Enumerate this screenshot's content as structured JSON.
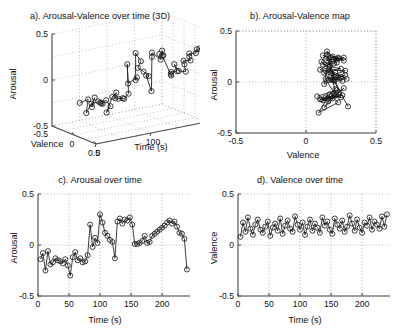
{
  "figure": {
    "background": "#ffffff",
    "line_color": "#1a1a1a",
    "grid_color": "#9a9a9a",
    "axis_color": "#4a4a4a",
    "marker": "circle-open"
  },
  "chart_data": [
    {
      "id": "a",
      "type": "scatter",
      "title": "a). Arousal-Valence over time (3D)",
      "projection": "3d",
      "xlabel": "Valence",
      "ylabel": "Time (s)",
      "zlabel": "Arousal",
      "xlim": [
        -0.5,
        0.5
      ],
      "ylim": [
        0,
        200
      ],
      "zlim": [
        -0.5,
        0.5
      ],
      "xticks": [
        0,
        0.5
      ],
      "xticklabels": [
        "0",
        "0.5"
      ],
      "yticks": [
        0,
        100,
        200
      ],
      "yticklabels": [
        "0",
        "100",
        "200"
      ],
      "zticks": [
        -0.5,
        0,
        0.5
      ],
      "zticklabels": [
        "-0.5",
        "0",
        "0.5"
      ],
      "extra_tick": "-0.5",
      "grid": true,
      "legend": "none",
      "connected": true,
      "n_points": 60,
      "x": [
        0.08,
        0.22,
        0.13,
        0.27,
        0.16,
        0.1,
        0.2,
        0.25,
        0.15,
        0.12,
        0.18,
        0.23,
        0.09,
        0.17,
        0.21,
        0.14,
        0.26,
        0.11,
        0.19,
        0.24,
        0.16,
        0.13,
        0.28,
        0.2,
        0.15,
        0.22,
        0.1,
        0.18,
        0.25,
        0.14,
        0.21,
        0.17,
        0.12,
        0.27,
        0.19,
        0.23,
        0.15,
        0.11,
        0.26,
        0.2,
        0.16,
        0.24,
        0.13,
        0.18,
        0.29,
        0.21,
        0.14,
        0.25,
        0.17,
        0.12,
        0.22,
        0.19,
        0.27,
        0.15,
        0.23,
        0.2,
        0.16,
        0.28,
        0.18,
        0.3
      ],
      "y": [
        4,
        8,
        12,
        16,
        20,
        24,
        28,
        32,
        36,
        40,
        44,
        48,
        52,
        56,
        60,
        64,
        68,
        72,
        76,
        80,
        84,
        88,
        92,
        96,
        100,
        104,
        108,
        112,
        116,
        120,
        124,
        128,
        132,
        136,
        140,
        144,
        148,
        152,
        156,
        160,
        164,
        168,
        172,
        176,
        180,
        184,
        188,
        192,
        196,
        200,
        204,
        208,
        212,
        216,
        220,
        224,
        228,
        232,
        236,
        240
      ],
      "z": [
        -0.14,
        -0.08,
        -0.25,
        -0.06,
        -0.19,
        -0.17,
        -0.13,
        -0.15,
        -0.16,
        -0.18,
        -0.14,
        -0.2,
        -0.3,
        -0.12,
        -0.07,
        -0.15,
        -0.13,
        -0.17,
        -0.16,
        -0.1,
        0.2,
        -0.02,
        0.07,
        0.02,
        0.3,
        0.22,
        0.12,
        0.09,
        0.05,
        0.03,
        -0.13,
        0.23,
        0.26,
        0.21,
        0.25,
        0.24,
        0.27,
        0.2,
        0.01,
        0.01,
        0.02,
        0.04,
        0.09,
        0.02,
        0.03,
        0.09,
        0.11,
        0.13,
        0.15,
        0.17,
        0.19,
        0.22,
        0.24,
        0.21,
        0.23,
        0.18,
        0.12,
        0.11,
        0.06,
        -0.24
      ]
    },
    {
      "id": "b",
      "type": "scatter",
      "title": "b). Arousal-Valence map",
      "xlabel": "Valence",
      "ylabel": "Arousal",
      "xlim": [
        -0.5,
        0.5
      ],
      "ylim": [
        -0.5,
        0.5
      ],
      "xticks": [
        -0.5,
        0,
        0.5
      ],
      "xticklabels": [
        "-0.5",
        "0",
        "0.5"
      ],
      "yticks": [
        -0.5,
        0,
        0.5
      ],
      "yticklabels": [
        "-0.5",
        "0",
        "0.5"
      ],
      "grid": true,
      "legend": "none",
      "connected": true,
      "n_points": 60,
      "x": [
        0.08,
        0.22,
        0.13,
        0.27,
        0.16,
        0.1,
        0.2,
        0.25,
        0.15,
        0.12,
        0.18,
        0.23,
        0.09,
        0.17,
        0.21,
        0.14,
        0.26,
        0.11,
        0.19,
        0.24,
        0.16,
        0.13,
        0.28,
        0.2,
        0.15,
        0.22,
        0.1,
        0.18,
        0.25,
        0.14,
        0.21,
        0.17,
        0.12,
        0.27,
        0.19,
        0.23,
        0.15,
        0.11,
        0.26,
        0.2,
        0.16,
        0.24,
        0.13,
        0.18,
        0.29,
        0.21,
        0.14,
        0.25,
        0.17,
        0.12,
        0.22,
        0.19,
        0.27,
        0.15,
        0.23,
        0.2,
        0.16,
        0.28,
        0.18,
        0.3
      ],
      "y": [
        -0.14,
        -0.08,
        -0.25,
        -0.06,
        -0.19,
        -0.17,
        -0.13,
        -0.15,
        -0.16,
        -0.18,
        -0.14,
        -0.2,
        -0.3,
        -0.12,
        -0.07,
        -0.15,
        -0.13,
        -0.17,
        -0.16,
        -0.1,
        0.2,
        -0.02,
        0.07,
        0.02,
        0.3,
        0.22,
        0.12,
        0.09,
        0.05,
        0.03,
        -0.13,
        0.23,
        0.26,
        0.21,
        0.25,
        0.24,
        0.27,
        0.2,
        0.01,
        0.01,
        0.02,
        0.04,
        0.09,
        0.02,
        0.03,
        0.09,
        0.11,
        0.13,
        0.15,
        0.17,
        0.19,
        0.22,
        0.24,
        0.21,
        0.23,
        0.18,
        0.12,
        0.11,
        0.06,
        -0.24
      ]
    },
    {
      "id": "c",
      "type": "line",
      "title": "c). Arousal over time",
      "xlabel": "Time (s)",
      "ylabel": "Arousal",
      "xlim": [
        0,
        245
      ],
      "ylim": [
        -0.5,
        0.5
      ],
      "xticks": [
        0,
        50,
        100,
        150,
        200
      ],
      "xticklabels": [
        "0",
        "50",
        "100",
        "150",
        "200"
      ],
      "yticks": [
        -0.5,
        0,
        0.5
      ],
      "yticklabels": [
        "-0.5",
        "0",
        "0.5"
      ],
      "grid": true,
      "legend": "none",
      "connected": true,
      "marker": "circle-open",
      "x": [
        4,
        8,
        12,
        16,
        20,
        24,
        28,
        32,
        36,
        40,
        44,
        48,
        52,
        56,
        60,
        64,
        68,
        72,
        76,
        80,
        84,
        88,
        92,
        96,
        100,
        104,
        108,
        112,
        116,
        120,
        124,
        128,
        132,
        136,
        140,
        144,
        148,
        152,
        156,
        160,
        164,
        168,
        172,
        176,
        180,
        184,
        188,
        192,
        196,
        200,
        204,
        208,
        212,
        216,
        220,
        224,
        228,
        232,
        236,
        240
      ],
      "y": [
        -0.14,
        -0.08,
        -0.25,
        -0.06,
        -0.19,
        -0.17,
        -0.13,
        -0.15,
        -0.16,
        -0.18,
        -0.14,
        -0.2,
        -0.3,
        -0.12,
        -0.07,
        -0.15,
        -0.13,
        -0.17,
        -0.16,
        -0.1,
        0.2,
        -0.02,
        0.07,
        0.02,
        0.3,
        0.22,
        0.12,
        0.09,
        0.05,
        0.03,
        -0.13,
        0.23,
        0.26,
        0.21,
        0.25,
        0.24,
        0.27,
        0.2,
        0.01,
        0.01,
        0.02,
        0.04,
        0.09,
        0.02,
        0.03,
        0.09,
        0.11,
        0.13,
        0.15,
        0.17,
        0.19,
        0.22,
        0.24,
        0.21,
        0.23,
        0.18,
        0.12,
        0.11,
        0.06,
        -0.24
      ]
    },
    {
      "id": "d",
      "type": "line",
      "title": "d). Valence over time",
      "xlabel": "Time (s)",
      "ylabel": "Valence",
      "xlim": [
        0,
        245
      ],
      "ylim": [
        -0.5,
        0.5
      ],
      "xticks": [
        0,
        50,
        100,
        150,
        200
      ],
      "xticklabels": [
        "0",
        "50",
        "100",
        "150",
        "200"
      ],
      "yticks": [
        -0.5,
        0,
        0.5
      ],
      "yticklabels": [
        "-0.5",
        "0",
        "0.5"
      ],
      "grid": true,
      "legend": "none",
      "connected": true,
      "marker": "circle-open",
      "x": [
        4,
        8,
        12,
        16,
        20,
        24,
        28,
        32,
        36,
        40,
        44,
        48,
        52,
        56,
        60,
        64,
        68,
        72,
        76,
        80,
        84,
        88,
        92,
        96,
        100,
        104,
        108,
        112,
        116,
        120,
        124,
        128,
        132,
        136,
        140,
        144,
        148,
        152,
        156,
        160,
        164,
        168,
        172,
        176,
        180,
        184,
        188,
        192,
        196,
        200,
        204,
        208,
        212,
        216,
        220,
        224,
        228,
        232,
        236,
        240
      ],
      "y": [
        0.08,
        0.22,
        0.13,
        0.27,
        0.16,
        0.1,
        0.2,
        0.25,
        0.15,
        0.12,
        0.18,
        0.23,
        0.09,
        0.17,
        0.21,
        0.14,
        0.26,
        0.11,
        0.19,
        0.24,
        0.16,
        0.13,
        0.28,
        0.2,
        0.15,
        0.22,
        0.1,
        0.18,
        0.25,
        0.14,
        0.21,
        0.17,
        0.12,
        0.27,
        0.19,
        0.23,
        0.15,
        0.11,
        0.26,
        0.2,
        0.16,
        0.24,
        0.13,
        0.18,
        0.29,
        0.21,
        0.14,
        0.25,
        0.17,
        0.12,
        0.22,
        0.19,
        0.27,
        0.15,
        0.23,
        0.2,
        0.16,
        0.28,
        0.18,
        0.3
      ]
    }
  ]
}
